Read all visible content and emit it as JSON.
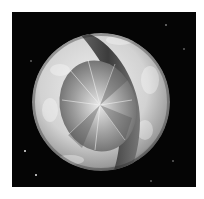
{
  "image": {
    "subject": "planet-cutaway-with-diamond-core",
    "background_color": "#050505",
    "margin_color": "#ffffff",
    "planet": {
      "center": [
        101,
        102
      ],
      "radius": 69,
      "surface_color": "#d6d6d6",
      "band_color": "#4a4a4a",
      "core_color": "#9a9a9a"
    },
    "stars": [
      {
        "x": 24,
        "y": 150
      },
      {
        "x": 35,
        "y": 174
      },
      {
        "x": 165,
        "y": 24
      },
      {
        "x": 183,
        "y": 48
      },
      {
        "x": 150,
        "y": 180
      },
      {
        "x": 172,
        "y": 160
      },
      {
        "x": 30,
        "y": 60
      }
    ]
  }
}
